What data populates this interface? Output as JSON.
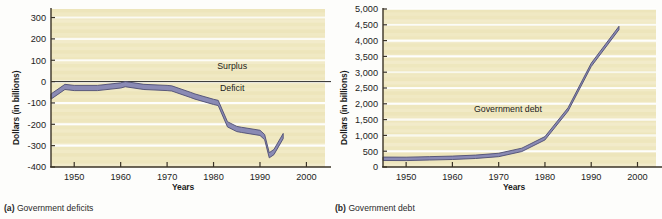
{
  "figure": {
    "panels": [
      {
        "id": "a",
        "caption_tag": "(a)",
        "caption_text": "Government deficits",
        "xlabel": "Years",
        "ylabel": "Dollars (in billions)"
      },
      {
        "id": "b",
        "caption_tag": "(b)",
        "caption_text": "Government debt",
        "xlabel": "Years",
        "ylabel": "Dollars (in billions)"
      }
    ],
    "colors": {
      "plot_background": "#f0e8c0",
      "gridline": "#ffffff",
      "axis": "#3a3326",
      "series_band_fill": "#8a8ab4",
      "series_band_edge": "#4d4d73",
      "text": "#1c1c1c"
    }
  },
  "chart_data": [
    {
      "type": "area",
      "panel": "a",
      "title": "Government deficits",
      "xlabel": "Years",
      "ylabel": "Dollars (in billions)",
      "xlim": [
        1945,
        2004
      ],
      "ylim": [
        -400,
        340
      ],
      "ytick_labels": [
        "300",
        "200",
        "100",
        "0",
        "-100",
        "-200",
        "-300",
        "-400"
      ],
      "ytick_values": [
        300,
        200,
        100,
        0,
        -100,
        -200,
        -300,
        -400
      ],
      "xtick_labels": [
        "1950",
        "1960",
        "1970",
        "1980",
        "1990",
        "2000"
      ],
      "xtick_values": [
        1950,
        1960,
        1970,
        1980,
        1990,
        2000
      ],
      "grid": true,
      "legend_position": "inline",
      "annotations": [
        {
          "text": "Surplus",
          "x": 1984,
          "y": 60
        },
        {
          "text": "Deficit",
          "x": 1984,
          "y": -45
        }
      ],
      "zero_line": 0,
      "x": [
        1945,
        1948,
        1950,
        1955,
        1960,
        1961,
        1965,
        1970,
        1971,
        1975,
        1976,
        1980,
        1981,
        1983,
        1985,
        1986,
        1990,
        1991,
        1992,
        1993,
        1995
      ],
      "values": [
        -70,
        -25,
        -30,
        -30,
        -18,
        -12,
        -25,
        -30,
        -32,
        -62,
        -70,
        -95,
        -100,
        -200,
        -222,
        -226,
        -240,
        -260,
        -345,
        -330,
        -255
      ]
    },
    {
      "type": "area",
      "panel": "b",
      "title": "Government debt",
      "xlabel": "Years",
      "ylabel": "Dollars (in billions)",
      "xlim": [
        1945,
        2004
      ],
      "ylim": [
        0,
        5000
      ],
      "ytick_labels": [
        "5,000",
        "4,500",
        "4,000",
        "3,500",
        "3,000",
        "2,500",
        "2,000",
        "1,500",
        "1,000",
        "500",
        "0"
      ],
      "ytick_values": [
        5000,
        4500,
        4000,
        3500,
        3000,
        2500,
        2000,
        1500,
        1000,
        500,
        0
      ],
      "xtick_labels": [
        "1950",
        "1960",
        "1970",
        "1980",
        "1990",
        "2000"
      ],
      "xtick_values": [
        1950,
        1960,
        1970,
        1980,
        1990,
        2000
      ],
      "grid": true,
      "legend_position": "inline",
      "annotations": [
        {
          "text": "Government debt",
          "x": 1972,
          "y": 1750
        }
      ],
      "x": [
        1945,
        1950,
        1955,
        1960,
        1965,
        1970,
        1975,
        1980,
        1985,
        1990,
        1996
      ],
      "values": [
        260,
        257,
        274,
        291,
        323,
        381,
        542,
        909,
        1823,
        3233,
        4400
      ]
    }
  ]
}
